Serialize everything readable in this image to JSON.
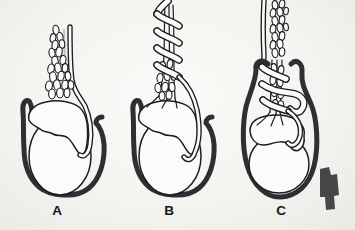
{
  "panels": [
    {
      "label": "A"
    },
    {
      "label": "B"
    },
    {
      "label": "C"
    }
  ],
  "colors": {
    "background_center": "#fbfaf8",
    "background_edge": "#eae9e5",
    "paper": "#fcfbf9",
    "ink": "#1c1d1f",
    "thick_outline": "#2d2f32",
    "artifact": "#454749",
    "label": "#17181a"
  }
}
